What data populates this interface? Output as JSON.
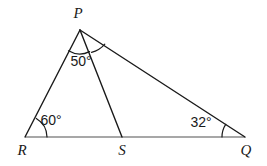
{
  "figure": {
    "kind": "geometry-diagram",
    "background_color": "#ffffff",
    "stroke_color_dark": "#1a1a1a",
    "stroke_color_gray": "#8a8a8a"
  },
  "vertices": [
    {
      "id": "P",
      "label": "P",
      "x": 80,
      "y": 30,
      "label_x": 78,
      "label_y": 18
    },
    {
      "id": "R",
      "label": "R",
      "x": 25,
      "y": 137,
      "label_x": 22,
      "label_y": 155
    },
    {
      "id": "S",
      "label": "S",
      "x": 122,
      "y": 137,
      "label_x": 122,
      "label_y": 155
    },
    {
      "id": "Q",
      "label": "Q",
      "x": 245,
      "y": 137,
      "label_x": 246,
      "label_y": 155
    }
  ],
  "segments": [
    {
      "id": "PR",
      "from": "P",
      "to": "R",
      "style": "dark"
    },
    {
      "id": "PS",
      "from": "P",
      "to": "S",
      "style": "dark"
    },
    {
      "id": "PQ",
      "from": "P",
      "to": "Q",
      "style": "dark"
    },
    {
      "id": "RQ",
      "from": "R",
      "to": "Q",
      "style": "gray"
    }
  ],
  "angles": [
    {
      "id": "angle-RPS",
      "vertex": "P",
      "label": "50°",
      "value": 50,
      "unit": "degrees",
      "label_x": 81,
      "label_y": 66,
      "arc_path": "M 68.5 50.8 A 22 22 0 0 0 89.6 51.6"
    },
    {
      "id": "angle-PRQ",
      "vertex": "R",
      "label": "60°",
      "value": 60,
      "unit": "degrees",
      "label_x": 51,
      "label_y": 125,
      "arc_path": "M 47 137 A 22 22 0 0 0 36.3 118.4"
    },
    {
      "id": "angle-PQR",
      "vertex": "Q",
      "label": "32°",
      "value": 32,
      "unit": "degrees",
      "label_x": 201,
      "label_y": 127,
      "arc_path": "M 222 137 A 23 23 0 0 1 225.7 124.3"
    },
    {
      "id": "angle-SPQ",
      "vertex": "P",
      "label": "",
      "value": null,
      "unit": "degrees",
      "label_x": null,
      "label_y": null,
      "arc_path": "M 91.5 52.4 A 25 25 0 0 0 104.8 44.2"
    }
  ]
}
